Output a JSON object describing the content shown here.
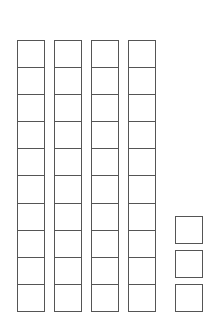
{
  "diagram": {
    "type": "base-ten-blocks",
    "line_color": "#555555",
    "background": "#ffffff",
    "tens_rods": {
      "count": 4,
      "cells_per_rod": 10,
      "value_each": 10
    },
    "ones_units": {
      "count": 3,
      "value_each": 1
    },
    "represented_value": 43
  }
}
